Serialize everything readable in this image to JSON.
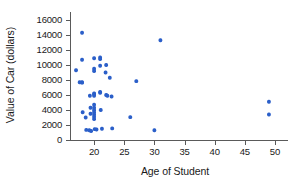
{
  "chart_data": {
    "type": "scatter",
    "title": "",
    "xlabel": "Age of Student",
    "ylabel": "Value of Car (dollars)",
    "xlim": [
      16,
      51.5
    ],
    "ylim": [
      0,
      16800
    ],
    "grid": false,
    "legend": "none",
    "marker_color": "#2B5FC9",
    "xticks": [
      20,
      25,
      30,
      35,
      40,
      45,
      50
    ],
    "xtick_labels": [
      "20",
      "25",
      "30",
      "35",
      "40",
      "45",
      "50"
    ],
    "yticks": [
      0,
      2000,
      4000,
      6000,
      8000,
      10000,
      12000,
      14000,
      16000
    ],
    "ytick_labels": [
      "0",
      "2000",
      "4000",
      "6000",
      "8000",
      "10000",
      "12000",
      "14000",
      "16000"
    ],
    "points": [
      {
        "x": 17.0,
        "y": 9300
      },
      {
        "x": 18.0,
        "y": 14300
      },
      {
        "x": 18.0,
        "y": 10700
      },
      {
        "x": 18.0,
        "y": 7700
      },
      {
        "x": 18.0,
        "y": 7650
      },
      {
        "x": 17.6,
        "y": 7700
      },
      {
        "x": 18.1,
        "y": 3700
      },
      {
        "x": 18.6,
        "y": 3000
      },
      {
        "x": 18.7,
        "y": 1350
      },
      {
        "x": 19.2,
        "y": 1300
      },
      {
        "x": 19.3,
        "y": 5900
      },
      {
        "x": 19.4,
        "y": 4300
      },
      {
        "x": 19.4,
        "y": 3500
      },
      {
        "x": 19.5,
        "y": 1200
      },
      {
        "x": 20.0,
        "y": 10900
      },
      {
        "x": 20.0,
        "y": 9500
      },
      {
        "x": 20.0,
        "y": 9200
      },
      {
        "x": 20.0,
        "y": 6200
      },
      {
        "x": 20.0,
        "y": 6100
      },
      {
        "x": 20.0,
        "y": 5900
      },
      {
        "x": 20.0,
        "y": 4700
      },
      {
        "x": 20.0,
        "y": 4300
      },
      {
        "x": 20.0,
        "y": 4000
      },
      {
        "x": 20.0,
        "y": 3700
      },
      {
        "x": 20.0,
        "y": 3400
      },
      {
        "x": 20.0,
        "y": 3100
      },
      {
        "x": 20.0,
        "y": 2800
      },
      {
        "x": 20.1,
        "y": 1450
      },
      {
        "x": 20.4,
        "y": 1400
      },
      {
        "x": 21.0,
        "y": 11000
      },
      {
        "x": 21.0,
        "y": 10800
      },
      {
        "x": 21.0,
        "y": 9900
      },
      {
        "x": 21.0,
        "y": 6400
      },
      {
        "x": 21.0,
        "y": 6300
      },
      {
        "x": 21.1,
        "y": 4000
      },
      {
        "x": 21.3,
        "y": 1500
      },
      {
        "x": 21.9,
        "y": 9000
      },
      {
        "x": 22.0,
        "y": 10000
      },
      {
        "x": 22.0,
        "y": 6000
      },
      {
        "x": 22.2,
        "y": 5900
      },
      {
        "x": 22.6,
        "y": 8300
      },
      {
        "x": 22.9,
        "y": 5800
      },
      {
        "x": 23.0,
        "y": 1550
      },
      {
        "x": 26.0,
        "y": 3050
      },
      {
        "x": 27.0,
        "y": 7850
      },
      {
        "x": 30.0,
        "y": 1300
      },
      {
        "x": 31.0,
        "y": 13300
      },
      {
        "x": 49.0,
        "y": 5100
      },
      {
        "x": 49.0,
        "y": 3400
      }
    ]
  },
  "axes_geometry": {
    "plot_left": 70,
    "plot_right": 284,
    "plot_top": 14,
    "plot_bottom": 140
  }
}
